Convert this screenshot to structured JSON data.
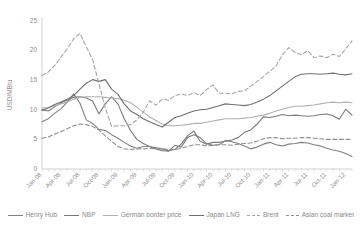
{
  "chart_data": {
    "type": "line",
    "title": "",
    "xlabel": "",
    "ylabel": "USD/MBtu",
    "ylim": [
      0,
      25
    ],
    "yticks": [
      0,
      5,
      10,
      15,
      20,
      25
    ],
    "grid": false,
    "legend_position": "bottom",
    "x": [
      "Jan-08",
      "Feb-08",
      "Mar-08",
      "Apr-08",
      "May-08",
      "Jun-08",
      "Jul-08",
      "Aug-08",
      "Sep-08",
      "Oct-08",
      "Nov-08",
      "Dec-08",
      "Jan-09",
      "Feb-09",
      "Mar-09",
      "Apr-09",
      "May-09",
      "Jun-09",
      "Jul-09",
      "Aug-09",
      "Sep-09",
      "Oct-09",
      "Nov-09",
      "Dec-09",
      "Jan-10",
      "Feb-10",
      "Mar-10",
      "Apr-10",
      "May-10",
      "Jun-10",
      "Jul-10",
      "Aug-10",
      "Sep-10",
      "Oct-10",
      "Nov-10",
      "Dec-10",
      "Jan-11",
      "Feb-11",
      "Mar-11",
      "Apr-11",
      "May-11",
      "Jun-11",
      "Jul-11",
      "Aug-11",
      "Sep-11",
      "Oct-11",
      "Nov-11",
      "Dec-11",
      "Jan-12",
      "Feb-12"
    ],
    "xtick_labels": [
      "Jan-08",
      "Apr-08",
      "Jul-08",
      "Oct-08",
      "Jan-09",
      "Apr-09",
      "Jul-09",
      "Oct-09",
      "Jan-10",
      "Apr-10",
      "Jul-10",
      "Oct-10",
      "Jan-11",
      "Apr-11",
      "Jul-11",
      "Oct-11",
      "Jan-12"
    ],
    "xtick_indices": [
      0,
      3,
      6,
      9,
      12,
      15,
      18,
      21,
      24,
      27,
      30,
      33,
      36,
      39,
      42,
      45,
      48
    ],
    "series": [
      {
        "name": "Henry Hub",
        "style": "solid",
        "color": "#808080",
        "values": [
          8.0,
          8.5,
          9.4,
          10.2,
          11.3,
          12.7,
          11.1,
          8.3,
          7.7,
          6.7,
          6.5,
          5.8,
          5.2,
          4.5,
          3.9,
          3.5,
          3.8,
          3.8,
          3.4,
          3.1,
          3.0,
          4.0,
          3.7,
          5.3,
          5.8,
          5.3,
          4.3,
          4.0,
          4.1,
          4.8,
          4.6,
          4.3,
          3.9,
          3.4,
          3.7,
          4.2,
          4.5,
          4.1,
          3.9,
          4.2,
          4.3,
          4.5,
          4.4,
          4.1,
          3.9,
          3.5,
          3.2,
          3.0,
          2.6,
          2.1
        ]
      },
      {
        "name": "NBP",
        "style": "solid",
        "color": "#7a7a7a",
        "values": [
          10.0,
          9.8,
          10.5,
          11.2,
          11.6,
          12.1,
          12.2,
          12.0,
          11.5,
          9.3,
          11.0,
          12.2,
          11.0,
          8.5,
          6.5,
          5.0,
          4.3,
          3.8,
          3.6,
          3.4,
          3.1,
          3.3,
          4.2,
          5.6,
          6.4,
          4.7,
          4.2,
          4.5,
          4.5,
          4.7,
          4.9,
          5.3,
          6.2,
          6.6,
          7.6,
          8.8,
          8.7,
          8.9,
          9.2,
          9.0,
          9.1,
          9.0,
          8.9,
          9.0,
          9.2,
          9.3,
          9.0,
          8.4,
          10.1,
          9.1
        ]
      },
      {
        "name": "German border price",
        "style": "solid",
        "color": "#b0b0b0",
        "values": [
          10.3,
          10.4,
          10.7,
          11.0,
          11.3,
          11.8,
          12.1,
          12.2,
          12.2,
          12.2,
          12.1,
          12.0,
          11.9,
          11.6,
          11.2,
          10.4,
          9.6,
          8.8,
          8.2,
          7.6,
          7.3,
          7.3,
          7.4,
          7.5,
          7.7,
          7.7,
          7.9,
          8.1,
          8.3,
          8.5,
          8.5,
          8.5,
          8.6,
          8.7,
          8.9,
          9.1,
          9.4,
          9.8,
          10.1,
          10.4,
          10.6,
          10.6,
          10.7,
          10.8,
          11.0,
          11.2,
          11.3,
          11.2,
          11.3,
          11.2
        ]
      },
      {
        "name": "Japan LNG",
        "style": "solid",
        "color": "#6f6f6f",
        "values": [
          9.9,
          10.3,
          10.9,
          11.3,
          11.8,
          12.4,
          13.5,
          14.5,
          15.1,
          14.8,
          15.1,
          13.5,
          12.6,
          11.0,
          9.8,
          9.2,
          8.5,
          8.0,
          7.5,
          7.1,
          7.9,
          8.7,
          9.0,
          9.4,
          9.8,
          10.0,
          10.1,
          10.4,
          10.7,
          11.0,
          10.9,
          10.8,
          10.7,
          10.9,
          11.3,
          11.8,
          12.4,
          13.2,
          14.0,
          14.8,
          15.6,
          16.0,
          16.1,
          16.1,
          16.0,
          16.1,
          16.2,
          16.0,
          15.9,
          16.1
        ]
      },
      {
        "name": "Brent",
        "style": "dashed",
        "color": "#a6a6a6",
        "values": [
          15.8,
          16.4,
          17.5,
          18.9,
          20.3,
          22.0,
          22.9,
          20.6,
          18.5,
          14.4,
          10.3,
          7.2,
          7.3,
          7.3,
          7.5,
          8.3,
          9.6,
          11.5,
          10.8,
          11.8,
          11.6,
          12.4,
          12.7,
          12.4,
          12.9,
          12.4,
          13.4,
          14.2,
          12.8,
          12.8,
          12.7,
          13.1,
          13.2,
          14.0,
          14.8,
          15.6,
          16.5,
          17.4,
          19.3,
          20.5,
          19.7,
          19.3,
          20.0,
          18.8,
          19.1,
          18.8,
          19.4,
          19.0,
          20.3,
          21.6
        ]
      },
      {
        "name": "Asian coal marker",
        "style": "dashed",
        "color": "#8f8f8f",
        "values": [
          5.2,
          5.4,
          5.9,
          6.3,
          6.8,
          7.3,
          7.6,
          7.5,
          7.2,
          6.6,
          5.6,
          4.7,
          3.8,
          3.4,
          3.3,
          3.4,
          3.4,
          3.5,
          3.4,
          3.4,
          3.3,
          3.3,
          3.5,
          3.8,
          4.1,
          4.1,
          3.9,
          4.0,
          4.1,
          4.1,
          4.0,
          4.2,
          4.3,
          4.4,
          4.7,
          5.1,
          5.3,
          5.3,
          5.1,
          5.2,
          5.2,
          5.3,
          5.3,
          5.2,
          5.1,
          5.0,
          5.0,
          5.0,
          5.0,
          5.0
        ]
      }
    ]
  },
  "legend": {
    "items": [
      {
        "label": "Henry Hub",
        "style": "solid",
        "color": "#808080"
      },
      {
        "label": "NBP",
        "style": "solid",
        "color": "#7a7a7a"
      },
      {
        "label": "German border price",
        "style": "solid",
        "color": "#b0b0b0"
      },
      {
        "label": "Japan LNG",
        "style": "solid",
        "color": "#6f6f6f"
      },
      {
        "label": "Brent",
        "style": "dashed",
        "color": "#a6a6a6"
      },
      {
        "label": "Asian coal marker",
        "style": "dashed",
        "color": "#8f8f8f"
      }
    ]
  }
}
